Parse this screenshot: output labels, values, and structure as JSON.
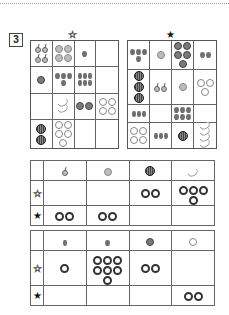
{
  "question_number": "3",
  "stars": {
    "left": {
      "symbol": "☆",
      "meaning": "white-star"
    },
    "right": {
      "symbol": "★",
      "meaning": "black-star"
    }
  },
  "left_grid": {
    "star": "white",
    "cells": [
      {
        "fruit": "cherry",
        "count": 4
      },
      {
        "fruit": "persimmon",
        "count": 4
      },
      {
        "fruit": "strawberry",
        "count": 1
      },
      {
        "fruit": "",
        "count": 0
      },
      {
        "fruit": "tomato",
        "count": 1
      },
      {
        "fruit": "strawberry",
        "count": 4
      },
      {
        "fruit": "grape",
        "count": 6
      },
      {
        "fruit": "",
        "count": 0
      },
      {
        "fruit": "",
        "count": 0
      },
      {
        "fruit": "banana",
        "count": 2
      },
      {
        "fruit": "tomato",
        "count": 2
      },
      {
        "fruit": "apple",
        "count": 4
      },
      {
        "fruit": "watermelon",
        "count": 2
      },
      {
        "fruit": "apple",
        "count": 5
      },
      {
        "fruit": "",
        "count": 0
      },
      {
        "fruit": "",
        "count": 0
      }
    ]
  },
  "right_grid": {
    "star": "black",
    "cells": [
      {
        "fruit": "strawberry",
        "count": 4
      },
      {
        "fruit": "persimmon",
        "count": 1
      },
      {
        "fruit": "tomato",
        "count": 5
      },
      {
        "fruit": "strawberry",
        "count": 2
      },
      {
        "fruit": "watermelon",
        "count": 3
      },
      {
        "fruit": "cherry",
        "count": 2
      },
      {
        "fruit": "persimmon",
        "count": 1
      },
      {
        "fruit": "apple",
        "count": 3
      },
      {
        "fruit": "grape",
        "count": 3
      },
      {
        "fruit": "",
        "count": 0
      },
      {
        "fruit": "strawberry",
        "count": 6
      },
      {
        "fruit": "",
        "count": 0
      },
      {
        "fruit": "apple",
        "count": 4
      },
      {
        "fruit": "grape",
        "count": 3
      },
      {
        "fruit": "watermelon",
        "count": 1
      },
      {
        "fruit": "banana",
        "count": 4
      }
    ]
  },
  "table1": {
    "columns": [
      "cherry",
      "persimmon",
      "watermelon",
      "banana"
    ],
    "rows": [
      {
        "label": "☆",
        "rings": [
          0,
          0,
          2,
          4
        ]
      },
      {
        "label": "★",
        "rings": [
          2,
          2,
          0,
          0
        ]
      }
    ]
  },
  "table2": {
    "columns": [
      "grape",
      "strawberry",
      "tomato",
      "apple"
    ],
    "rows": [
      {
        "label": "☆",
        "rings": [
          1,
          7,
          2,
          0
        ]
      },
      {
        "label": "★",
        "rings": [
          0,
          0,
          0,
          2
        ]
      }
    ]
  }
}
